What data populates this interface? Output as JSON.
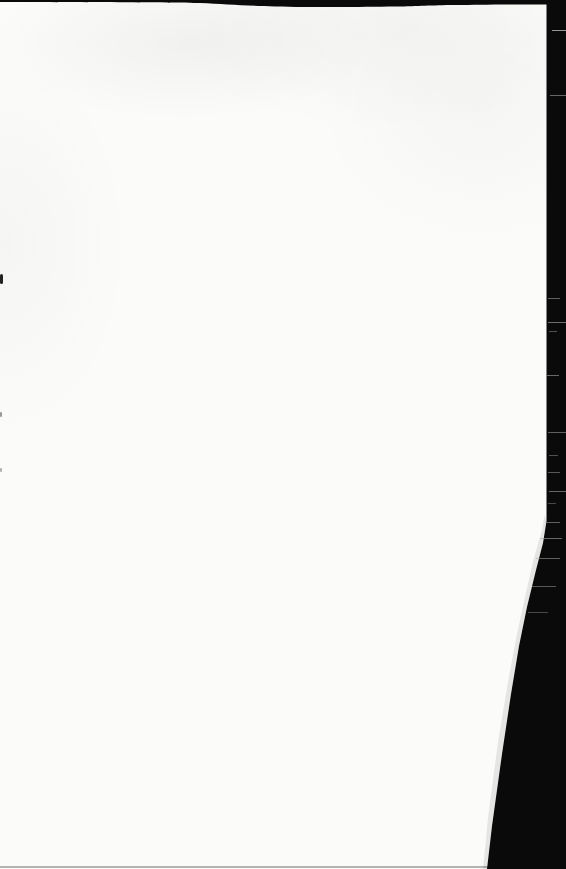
{
  "document": {
    "type": "scanned-book-page",
    "visible_text": ""
  },
  "colors": {
    "paper": "#fbfbfa",
    "ink_black": "#0a0a0a",
    "edge_shadow": "rgba(40,40,36,0.10)",
    "bottom_edge": "#9c9c9a",
    "hairline": "#a6a6a4",
    "speck": "#22221f"
  }
}
